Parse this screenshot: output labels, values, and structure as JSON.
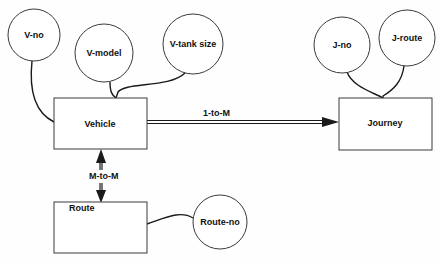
{
  "diagram": {
    "type": "entity-relationship",
    "entities": [
      {
        "id": "vehicle",
        "label": "Vehicle"
      },
      {
        "id": "journey",
        "label": "Journey"
      },
      {
        "id": "route",
        "label": "Route"
      }
    ],
    "attributes": [
      {
        "id": "v-no",
        "label": "V-no",
        "entity": "vehicle"
      },
      {
        "id": "v-model",
        "label": "V-model",
        "entity": "vehicle"
      },
      {
        "id": "v-tank-size",
        "label": "V-tank size",
        "entity": "vehicle"
      },
      {
        "id": "j-no",
        "label": "J-no",
        "entity": "journey"
      },
      {
        "id": "j-route",
        "label": "J-route",
        "entity": "journey"
      },
      {
        "id": "route-no",
        "label": "Route-no",
        "entity": "route"
      }
    ],
    "relationships": [
      {
        "from": "vehicle",
        "to": "journey",
        "label": "1-to-M",
        "arrow": "single"
      },
      {
        "from": "vehicle",
        "to": "route",
        "label": "M-to-M",
        "arrow": "double"
      }
    ],
    "colors": {
      "line": "#1a1a1a",
      "shape_border": "#3a3a3a",
      "background": "#fefefe"
    }
  }
}
